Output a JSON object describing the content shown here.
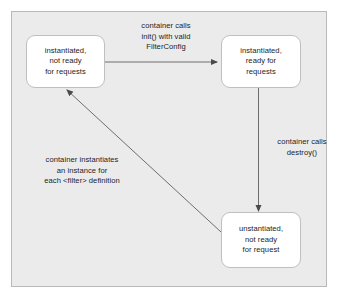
{
  "diagram": {
    "type": "state-diagram",
    "colors": {
      "panel_background": "#ebebeb",
      "panel_border": "#b9b9b9",
      "box_fill": "#ffffff",
      "box_border": "#bfbfbf",
      "text": "#1d1d1d",
      "arrow": "#6e6e6e",
      "page_background": "#ffffff"
    },
    "states": [
      {
        "id": "instantiated-not-ready",
        "lines": [
          "instantiated,",
          "not ready",
          "for requests"
        ]
      },
      {
        "id": "instantiated-ready",
        "lines": [
          "instantiated,",
          "ready for",
          "requests"
        ]
      },
      {
        "id": "unstantiated",
        "lines": [
          "unstantiated,",
          "not ready",
          "for request"
        ]
      }
    ],
    "transitions": [
      {
        "id": "init",
        "from": "instantiated-not-ready",
        "to": "instantiated-ready",
        "lines": [
          "container calls",
          "init() with valid",
          "FilterConfig"
        ]
      },
      {
        "id": "destroy",
        "from": "instantiated-ready",
        "to": "unstantiated",
        "lines": [
          "container calls",
          "destroy()"
        ]
      },
      {
        "id": "instantiates",
        "from": "unstantiated",
        "to": "instantiated-not-ready",
        "lines": [
          "container instantiates",
          "an instance for",
          "each <filter> definition"
        ]
      }
    ]
  }
}
